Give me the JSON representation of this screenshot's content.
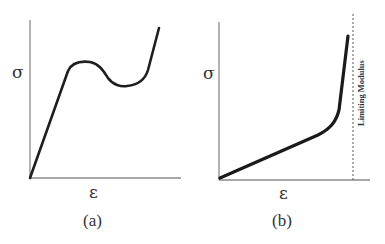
{
  "panels": [
    {
      "id": "a",
      "y_label": "σ",
      "x_label": "ε",
      "caption": "(a)",
      "curve_description": "linear rise, yield peak, strain softening dip, then steep hardening"
    },
    {
      "id": "b",
      "y_label": "σ",
      "x_label": "ε",
      "caption": "(b)",
      "curve_description": "gradual linear rise then sharp upturn approaching limit",
      "asymptote_label": "Limiting Modulus"
    }
  ],
  "colors": {
    "curve": "#1e1e1e",
    "axis": "#8a8a8a",
    "text": "#333333"
  }
}
